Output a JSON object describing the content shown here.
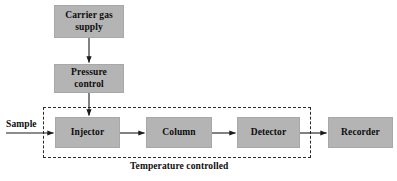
{
  "diagram": {
    "caption": "Temperature controlled",
    "sample_label": "Sample",
    "colors": {
      "box_fill": "#b4b4b4",
      "box_border": "#a8a8a8",
      "line": "#1a1a1a",
      "dashed_border": "#2b2b2b",
      "background": "#ffffff",
      "text": "#0d0d0d"
    },
    "boxes": [
      {
        "id": "carrier-gas-supply",
        "label": "Carrier gas supply",
        "line1": "Carrier gas",
        "line2": "supply"
      },
      {
        "id": "pressure-control",
        "label": "Pressure control",
        "line1": "Pressure",
        "line2": "control"
      },
      {
        "id": "injector",
        "label": "Injector",
        "line1": "Injector",
        "line2": ""
      },
      {
        "id": "column",
        "label": "Column",
        "line1": "Column",
        "line2": ""
      },
      {
        "id": "detector",
        "label": "Detector",
        "line1": "Detector",
        "line2": ""
      },
      {
        "id": "recorder",
        "label": "Recorder",
        "line1": "Recorder",
        "line2": ""
      }
    ],
    "connections": [
      {
        "from": "carrier-gas-supply",
        "to": "pressure-control",
        "direction": "down"
      },
      {
        "from": "pressure-control",
        "to": "injector",
        "direction": "down"
      },
      {
        "from": "sample",
        "to": "injector",
        "direction": "right"
      },
      {
        "from": "injector",
        "to": "column",
        "direction": "right"
      },
      {
        "from": "column",
        "to": "detector",
        "direction": "right"
      },
      {
        "from": "detector",
        "to": "recorder",
        "direction": "right"
      }
    ],
    "enclosure": {
      "label": "Temperature controlled",
      "contains": [
        "injector",
        "column",
        "detector"
      ]
    }
  }
}
